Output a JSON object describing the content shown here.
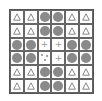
{
  "puzzle": {
    "rows": 6,
    "cols": 6,
    "cells": [
      [
        "triangle",
        "triangle",
        "circle",
        "circle",
        "triangle",
        "triangle"
      ],
      [
        "triangle",
        "triangle",
        "circle",
        "circle",
        "triangle",
        "triangle"
      ],
      [
        "circle",
        "circle",
        "plus",
        "plus",
        "circle",
        "circle"
      ],
      [
        "circle",
        "circle",
        "dots",
        "plus",
        "circle",
        "circle"
      ],
      [
        "triangle",
        "triangle",
        "circle",
        "circle",
        "triangle",
        "triangle"
      ],
      [
        "triangle",
        "triangle",
        "circle",
        "circle",
        "triangle",
        "triangle"
      ]
    ],
    "colors": {
      "circle": "#8a8a8a",
      "triangle": "#888888",
      "plus": "#999999",
      "dots": "#888888",
      "grid": "#555555"
    }
  }
}
